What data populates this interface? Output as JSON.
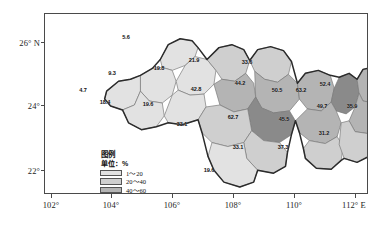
{
  "figure": {
    "type": "choropleth-map",
    "unit_note": "单位：%"
  },
  "axes": {
    "x_ticks": [
      "102°",
      "104°",
      "106°",
      "108°",
      "110°",
      "112° E"
    ],
    "y_ticks": [
      "26° N",
      "24°",
      "22°"
    ]
  },
  "legend": {
    "title": "图例",
    "unit": "单位：%",
    "classes": [
      {
        "label": "1～20",
        "color": "#e2e2e2"
      },
      {
        "label": "20～40",
        "color": "#cfcfcf"
      },
      {
        "label": "40～60",
        "color": "#b4b4b4"
      },
      {
        "label": "60～100",
        "color": "#8a8a8a"
      }
    ]
  },
  "colors": {
    "class1": "#e2e2e2",
    "class2": "#cfcfcf",
    "class3": "#b4b4b4",
    "class4": "#8a8a8a",
    "background": "#ffffff",
    "outline": "#2b2b2b",
    "inner_border": "#7a7a7a",
    "frame": "#4a4a4a"
  },
  "chart_data": {
    "type": "map",
    "title": "",
    "xlabel": "",
    "ylabel": "",
    "xlim": [
      102,
      112
    ],
    "ylim": [
      21.2,
      26.8
    ],
    "grid": false,
    "legend_position": "bottom-left",
    "value_unit": "%",
    "categories": [
      "r1",
      "r2",
      "r3",
      "r4",
      "r5",
      "r6",
      "r7",
      "r8",
      "r9",
      "r10",
      "r11",
      "r12",
      "r13",
      "r14",
      "r15",
      "r16",
      "r17",
      "r18",
      "r19",
      "r20",
      "r21",
      "r22"
    ],
    "values": [
      5.6,
      9.3,
      4.7,
      18.4,
      19.8,
      19.6,
      21.9,
      33.6,
      42.8,
      44.2,
      50.5,
      63.2,
      52.4,
      49.7,
      35.9,
      62.7,
      33.1,
      45.5,
      33.1,
      37.3,
      31.2,
      19.6
    ],
    "regions": [
      {
        "id": "r1",
        "value": "5.6",
        "cls": 1,
        "x": 126,
        "y": 37
      },
      {
        "id": "r2",
        "value": "9.3",
        "cls": 1,
        "x": 112,
        "y": 73
      },
      {
        "id": "r3",
        "value": "4.7",
        "cls": 1,
        "x": 83,
        "y": 90
      },
      {
        "id": "r4",
        "value": "18.4",
        "cls": 1,
        "x": 105,
        "y": 102
      },
      {
        "id": "r5",
        "value": "19.8",
        "cls": 1,
        "x": 159,
        "y": 68
      },
      {
        "id": "r6",
        "value": "19.6",
        "cls": 1,
        "x": 148,
        "y": 104
      },
      {
        "id": "r7",
        "value": "21.9",
        "cls": 2,
        "x": 194,
        "y": 60
      },
      {
        "id": "r8",
        "value": "33.6",
        "cls": 2,
        "x": 247,
        "y": 62
      },
      {
        "id": "r9",
        "value": "42.8",
        "cls": 3,
        "x": 196,
        "y": 89
      },
      {
        "id": "r10",
        "value": "44.2",
        "cls": 3,
        "x": 240,
        "y": 83
      },
      {
        "id": "r11",
        "value": "50.5",
        "cls": 3,
        "x": 277,
        "y": 90
      },
      {
        "id": "r12",
        "value": "63.2",
        "cls": 4,
        "x": 301,
        "y": 90
      },
      {
        "id": "r13",
        "value": "52.4",
        "cls": 3,
        "x": 325,
        "y": 84
      },
      {
        "id": "r14",
        "value": "49.7",
        "cls": 3,
        "x": 322,
        "y": 106
      },
      {
        "id": "r15",
        "value": "35.9",
        "cls": 2,
        "x": 352,
        "y": 106
      },
      {
        "id": "r16",
        "value": "62.7",
        "cls": 4,
        "x": 233,
        "y": 117
      },
      {
        "id": "r17",
        "value": "33.1",
        "cls": 2,
        "x": 182,
        "y": 124
      },
      {
        "id": "r18",
        "value": "45.5",
        "cls": 3,
        "x": 284,
        "y": 119
      },
      {
        "id": "r19",
        "value": "33.1",
        "cls": 2,
        "x": 238,
        "y": 147
      },
      {
        "id": "r20",
        "value": "37.3",
        "cls": 2,
        "x": 283,
        "y": 147
      },
      {
        "id": "r21",
        "value": "31.2",
        "cls": 2,
        "x": 324,
        "y": 133
      },
      {
        "id": "r22",
        "value": "19.6",
        "cls": 1,
        "x": 209,
        "y": 170
      }
    ]
  }
}
